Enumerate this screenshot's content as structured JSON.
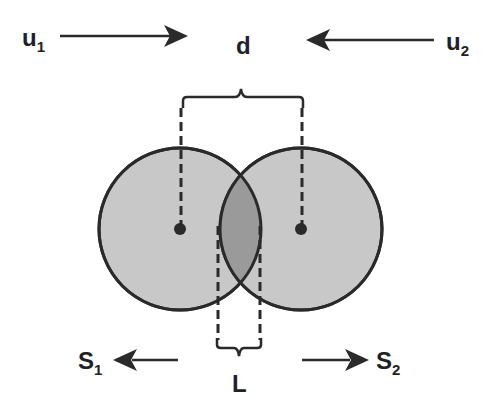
{
  "labels": {
    "u1_main": "u",
    "u1_sub": "1",
    "u2_main": "u",
    "u2_sub": "2",
    "s1_main": "S",
    "s1_sub": "1",
    "s2_main": "S",
    "s2_sub": "2",
    "d": "d",
    "L": "L"
  },
  "colors": {
    "circle_fill": "#c8c8c8",
    "overlap_fill": "#9a9a9a",
    "stroke": "#2a2a2a"
  }
}
